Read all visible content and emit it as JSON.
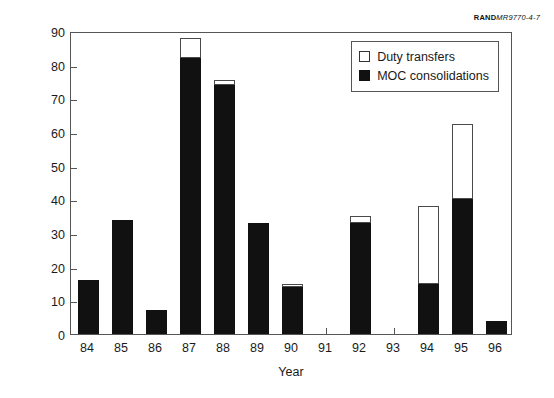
{
  "source_credit": {
    "rand": "RAND",
    "doc": "MR9770-4-7"
  },
  "chart_data": {
    "type": "bar",
    "barmode": "stacked",
    "title": "",
    "subtitle": "",
    "xlabel": "Year",
    "ylabel": "Number of MOC changes",
    "categories": [
      "84",
      "85",
      "86",
      "87",
      "88",
      "89",
      "90",
      "91",
      "92",
      "93",
      "94",
      "95",
      "96"
    ],
    "series": [
      {
        "name": "MOC consolidations",
        "color": "#111111",
        "values": [
          16,
          34,
          7,
          82,
          74,
          33,
          14,
          0,
          33,
          0,
          15,
          40,
          4
        ]
      },
      {
        "name": "Duty transfers",
        "color": "#ffffff",
        "values": [
          0,
          0,
          0,
          6,
          1.5,
          0,
          1,
          0,
          2,
          0,
          23,
          22.5,
          0
        ]
      }
    ],
    "totals": [
      16,
      34,
      7,
      88,
      75.5,
      33,
      15,
      0,
      35,
      0,
      38,
      62.5,
      4
    ],
    "ylim": [
      0,
      90
    ],
    "ytick_step": 10,
    "yticks": [
      0,
      10,
      20,
      30,
      40,
      50,
      60,
      70,
      80,
      90
    ],
    "grid": false,
    "legend_position": "top-right-inside",
    "legend": [
      {
        "label": "Duty transfers",
        "swatch": "open"
      },
      {
        "label": "MOC consolidations",
        "swatch": "solid"
      }
    ]
  }
}
